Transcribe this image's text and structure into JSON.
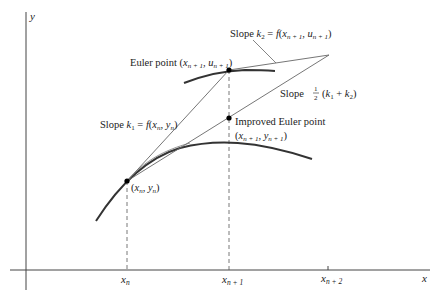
{
  "figure": {
    "axes": {
      "x_label": "x",
      "y_label": "y",
      "ticks": [
        {
          "base": "x",
          "sub": "n"
        },
        {
          "base": "x",
          "sub": "n + 1"
        },
        {
          "base": "x",
          "sub": "n + 2"
        }
      ]
    },
    "points": {
      "start": {
        "label_prefix": "(",
        "x": "x",
        "x_sub": "n",
        "sep": ", ",
        "y": "y",
        "y_sub": "n",
        "label_suffix": ")"
      },
      "euler": {
        "title": "Euler point (",
        "x": "x",
        "x_sub": "n + 1",
        "sep": ", ",
        "y": "u",
        "y_sub": "n + 1",
        "suffix": ")"
      },
      "improved": {
        "title": "Improved Euler point",
        "x": "x",
        "x_sub": "n + 1",
        "sep": ", ",
        "y": "y",
        "y_sub": "n + 1",
        "prefix": "(",
        "suffix": ")"
      }
    },
    "slopes": {
      "k1": {
        "prefix": "Slope ",
        "k": "k",
        "k_sub": "1",
        "eq": " = ",
        "f": "f",
        "open": "(",
        "x": "x",
        "x_sub": "n",
        "sep": ", ",
        "y": "y",
        "y_sub": "n",
        "close": ")"
      },
      "k2": {
        "prefix": "Slope ",
        "k": "k",
        "k_sub": "2",
        "eq": " = ",
        "f": "f",
        "open": "(",
        "x": "x",
        "x_sub": "n + 1",
        "sep": ", ",
        "y": "u",
        "y_sub": "n + 1",
        "close": ")"
      },
      "avg": {
        "prefix": "Slope  ",
        "num": "1",
        "den": "2",
        "open": "(",
        "k1": "k",
        "k1_sub": "1",
        "plus": " + ",
        "k2": "k",
        "k2_sub": "2",
        "close": ")"
      }
    },
    "colors": {
      "curve": "#333333",
      "line": "#555555",
      "point": "#000000",
      "text": "#222222"
    }
  }
}
